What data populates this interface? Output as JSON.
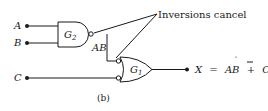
{
  "diagram": {
    "type": "logic-circuit",
    "caption": "(b)",
    "annotation": "Inversions cancel",
    "inputs": [
      {
        "name": "A"
      },
      {
        "name": "B"
      },
      {
        "name": "C"
      }
    ],
    "gates": [
      {
        "id": "G2",
        "label": "G",
        "sub": "2",
        "kind": "NAND",
        "inputs": [
          "A",
          "B"
        ]
      },
      {
        "id": "G1",
        "label": "G",
        "sub": "1",
        "kind": "OR with inverted inputs",
        "inputs": [
          "G2 output",
          "C"
        ]
      }
    ],
    "wire_label": "AB",
    "output": {
      "lhs": "X",
      "eq": "=",
      "term1": "AB",
      "plus": "+",
      "term2": "C",
      "term2_overbar": true
    }
  }
}
